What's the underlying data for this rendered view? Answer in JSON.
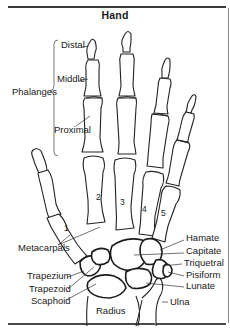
{
  "title": "Hand",
  "labels": {
    "phalanges": "Phalanges",
    "distal": "Distal",
    "middle": "Middle",
    "proximal": "Proximal",
    "metacarpals": "Metacarpals",
    "trapezium": "Trapezium",
    "trapezoid": "Trapezoid",
    "scaphoid": "Scaphoid",
    "radius": "Radius",
    "ulna": "Ulna",
    "hamate": "Hamate",
    "capitate": "Capitate",
    "triquetral": "Triquetral",
    "pisiform": "Pisiform",
    "lunate": "Lunate"
  },
  "metacarpal_numbers": [
    "1",
    "2",
    "3",
    "4",
    "5"
  ]
}
